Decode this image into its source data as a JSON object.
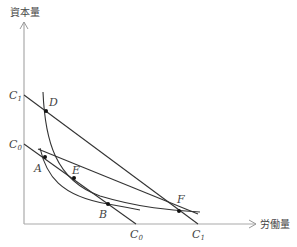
{
  "diagram": {
    "type": "isocost-isoquant",
    "axes": {
      "y_label": "資本量",
      "x_label": "労働量"
    },
    "isocost_lines": [
      {
        "name": "C0",
        "y_intercept_label": "C",
        "y_sub": "0",
        "x_intercept_label": "C",
        "x_sub": "0"
      },
      {
        "name": "C1",
        "y_intercept_label": "C",
        "y_sub": "1",
        "x_intercept_label": "C",
        "x_sub": "1"
      }
    ],
    "points": {
      "A": "A",
      "B": "B",
      "D": "D",
      "E": "E",
      "F": "F"
    },
    "colors": {
      "line": "#333333",
      "axis": "#999999",
      "text": "#444444"
    }
  }
}
